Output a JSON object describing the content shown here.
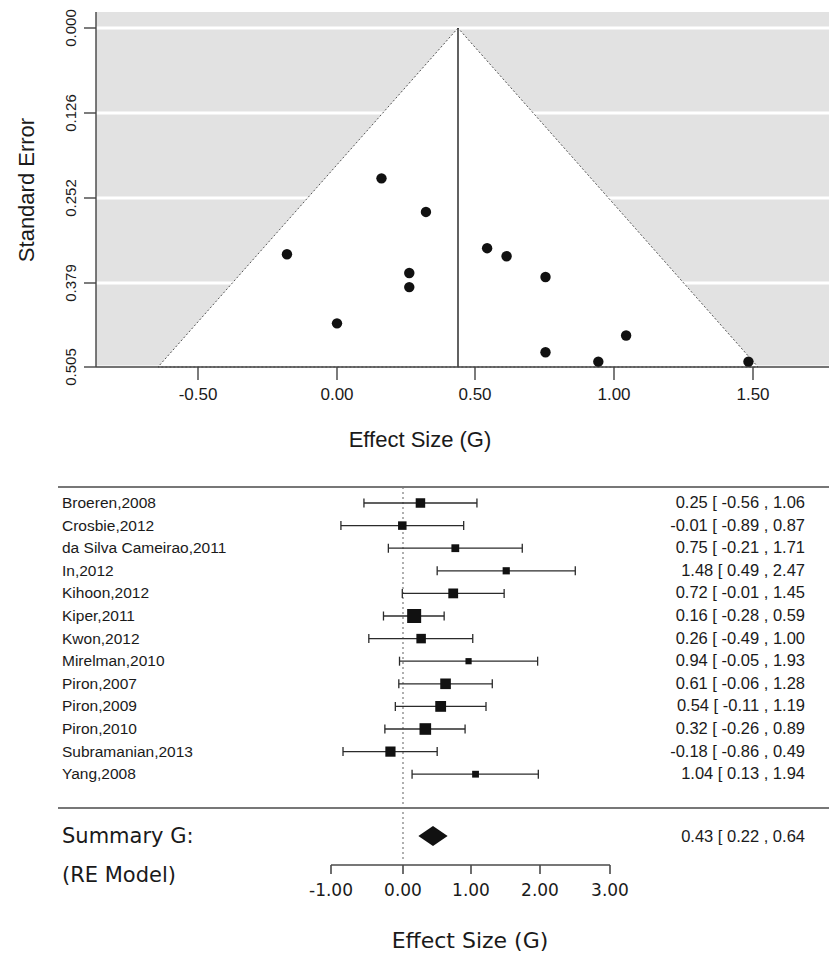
{
  "chart_data": [
    {
      "type": "scatter",
      "name": "funnel-plot",
      "title": "",
      "xlabel": "Effect Size (G)",
      "ylabel": "Standard Error",
      "xlim": [
        -0.8,
        1.8
      ],
      "ylim": [
        0.0,
        0.545
      ],
      "y_inverted": true,
      "grid": true,
      "legend": "none",
      "xticks": [
        "-0.50",
        "0.00",
        "0.50",
        "1.00",
        "1.50"
      ],
      "xtick_values": [
        -0.5,
        0.0,
        0.5,
        1.0,
        1.5
      ],
      "yticks": [
        "0.000",
        "0.126",
        "0.252",
        "0.379",
        "0.505"
      ],
      "ytick_values": [
        0.0,
        0.126,
        0.252,
        0.379,
        0.505
      ],
      "center_estimate": 0.43,
      "pseudo_ci_slope": 1.96,
      "points": [
        {
          "x": 0.16,
          "y": 0.224
        },
        {
          "x": 0.32,
          "y": 0.274
        },
        {
          "x": -0.18,
          "y": 0.337
        },
        {
          "x": 0.54,
          "y": 0.328
        },
        {
          "x": 0.61,
          "y": 0.34
        },
        {
          "x": 0.26,
          "y": 0.365
        },
        {
          "x": 0.75,
          "y": 0.371
        },
        {
          "x": 0.26,
          "y": 0.386
        },
        {
          "x": 0.0,
          "y": 0.44
        },
        {
          "x": 1.04,
          "y": 0.458
        },
        {
          "x": 0.75,
          "y": 0.483
        },
        {
          "x": 0.94,
          "y": 0.497
        },
        {
          "x": 1.48,
          "y": 0.497
        }
      ]
    },
    {
      "type": "table",
      "name": "forest-plot",
      "title": "",
      "xlabel": "Effect Size (G)",
      "ylabel": "",
      "xlim": [
        -1.3,
        3.2
      ],
      "xticks": [
        "-1.00",
        "0.00",
        "1.00",
        "2.00",
        "3.00"
      ],
      "xtick_values": [
        -1.0,
        0.0,
        1.0,
        2.0,
        3.0
      ],
      "reference_line": 0.0,
      "columns": [
        "Study",
        "Estimate [95% CI]"
      ],
      "rows": [
        {
          "label": "Broeren,2008",
          "estimate": 0.25,
          "lower": -0.56,
          "upper": 1.06,
          "weight": 0.55,
          "text": "0.25 [ -0.56 , 1.06"
        },
        {
          "label": "Crosbie,2012",
          "estimate": -0.01,
          "lower": -0.89,
          "upper": 0.87,
          "weight": 0.45,
          "text": "-0.01 [ -0.89 , 0.87"
        },
        {
          "label": "da Silva Cameirao,2011",
          "estimate": 0.75,
          "lower": -0.21,
          "upper": 1.71,
          "weight": 0.38,
          "text": "0.75 [ -0.21 , 1.71"
        },
        {
          "label": "In,2012",
          "estimate": 1.48,
          "lower": 0.49,
          "upper": 2.47,
          "weight": 0.32,
          "text": "1.48 [  0.49 , 2.47"
        },
        {
          "label": "Kihoon,2012",
          "estimate": 0.72,
          "lower": -0.01,
          "upper": 1.45,
          "weight": 0.58,
          "text": "0.72 [ -0.01 , 1.45"
        },
        {
          "label": "Kiper,2011",
          "estimate": 0.16,
          "lower": -0.28,
          "upper": 0.59,
          "weight": 1.0,
          "text": "0.16 [ -0.28 , 0.59"
        },
        {
          "label": "Kwon,2012",
          "estimate": 0.26,
          "lower": -0.49,
          "upper": 1.0,
          "weight": 0.55,
          "text": "0.26 [ -0.49 , 1.00"
        },
        {
          "label": "Mirelman,2010",
          "estimate": 0.94,
          "lower": -0.05,
          "upper": 1.93,
          "weight": 0.22,
          "text": "0.94 [ -0.05 , 1.93"
        },
        {
          "label": "Piron,2007",
          "estimate": 0.61,
          "lower": -0.06,
          "upper": 1.28,
          "weight": 0.66,
          "text": "0.61 [ -0.06 , 1.28"
        },
        {
          "label": "Piron,2009",
          "estimate": 0.54,
          "lower": -0.11,
          "upper": 1.19,
          "weight": 0.68,
          "text": "0.54 [ -0.11 , 1.19"
        },
        {
          "label": "Piron,2010",
          "estimate": 0.32,
          "lower": -0.26,
          "upper": 0.89,
          "weight": 0.76,
          "text": "0.32 [ -0.26 , 0.89"
        },
        {
          "label": "Subramanian,2013",
          "estimate": -0.18,
          "lower": -0.86,
          "upper": 0.49,
          "weight": 0.62,
          "text": "-0.18 [ -0.86 , 0.49"
        },
        {
          "label": "Yang,2008",
          "estimate": 1.04,
          "lower": 0.13,
          "upper": 1.94,
          "weight": 0.28,
          "text": "1.04 [  0.13 , 1.94"
        }
      ],
      "summary": {
        "label_line1": "Summary G:",
        "label_line2": "(RE Model)",
        "estimate": 0.43,
        "lower": 0.22,
        "upper": 0.64,
        "text": "0.43 [  0.22 , 0.64"
      }
    }
  ],
  "funnel": {
    "ylabel": "Standard Error",
    "xlabel": "Effect Size (G)",
    "ytick_labels": [
      "0.000",
      "0.126",
      "0.252",
      "0.379",
      "0.505"
    ],
    "xtick_labels": [
      "-0.50",
      "0.00",
      "0.50",
      "1.00",
      "1.50"
    ]
  },
  "forest": {
    "xlabel": "Effect Size (G)",
    "xtick_labels": [
      "-1.00",
      "0.00",
      "1.00",
      "2.00",
      "3.00"
    ],
    "summary_line1": "Summary G:",
    "summary_line2": "(RE Model)",
    "summary_value": "0.43 [  0.22 , 0.64",
    "study_labels": [
      "Broeren,2008",
      "Crosbie,2012",
      "da Silva Cameirao,2011",
      "In,2012",
      "Kihoon,2012",
      "Kiper,2011",
      "Kwon,2012",
      "Mirelman,2010",
      "Piron,2007",
      "Piron,2009",
      "Piron,2010",
      "Subramanian,2013",
      "Yang,2008"
    ],
    "study_values": [
      "0.25 [ -0.56 , 1.06",
      "-0.01 [ -0.89 , 0.87",
      "0.75 [ -0.21 , 1.71",
      "1.48 [  0.49 , 2.47",
      "0.72 [ -0.01 , 1.45",
      "0.16 [ -0.28 , 0.59",
      "0.26 [ -0.49 , 1.00",
      "0.94 [ -0.05 , 1.93",
      "0.61 [ -0.06 , 1.28",
      "0.54 [ -0.11 , 1.19",
      "0.32 [ -0.26 , 0.89",
      "-0.18 [ -0.86 , 0.49",
      "1.04 [  0.13 , 1.94"
    ]
  },
  "colors": {
    "plot_background": "#e2e2e2",
    "funnel_fill": "#ffffff",
    "point": "#111111",
    "axis": "#444444",
    "grid": "#ffffff"
  }
}
